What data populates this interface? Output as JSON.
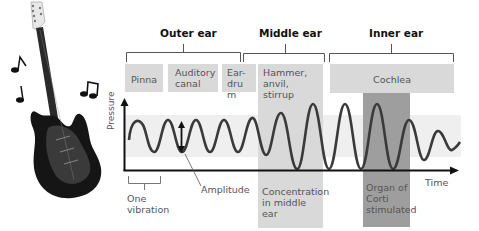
{
  "sections": {
    "outer": {
      "label": "Outer ear"
    },
    "middle": {
      "label": "Middle ear"
    },
    "inner": {
      "label": "Inner ear"
    }
  },
  "parts": {
    "pinna": "Pinna",
    "auditory_canal": "Auditory canal",
    "eardrum": "Ear-drum",
    "ossicles": "Hammer, anvil, stirrup",
    "cochlea": "Cochlea"
  },
  "axes": {
    "y_label": "Pressure",
    "x_label": "Time"
  },
  "annotations": {
    "amplitude": "Amplitude",
    "one_vibration": "One vibration",
    "concentration": "Concentration in middle ear",
    "organ_of_corti": "Organ of Corti stimulated"
  },
  "colors": {
    "box": "#d9d9d9",
    "organ_box": "#9e9e9e",
    "band": "#efefef",
    "wave": "#3a3a3a"
  },
  "illustration": {
    "guitar": "electric-guitar",
    "notes": [
      "eighth-note",
      "eighth-note",
      "beamed-notes"
    ]
  }
}
